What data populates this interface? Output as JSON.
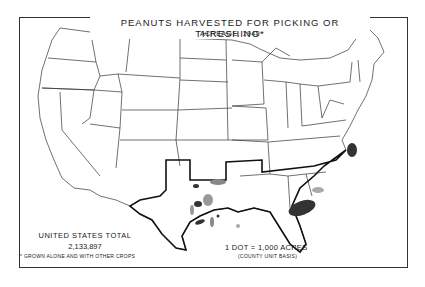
{
  "map": {
    "title": "PEANUTS HARVESTED FOR PICKING OR THRESHING*",
    "subtitle": "ACREAGE, 1949",
    "region": "United States",
    "highlighted_region_outline": "Southern peanut-growing states (Texas, Oklahoma, Louisiana, Mississippi, Alabama, Georgia, Florida, South Carolina)",
    "total": {
      "label": "UNITED STATES TOTAL",
      "value": "2,133,897"
    },
    "footnote": "* GROWN ALONE AND WITH OTHER CROPS",
    "legend": {
      "dot_value": "1 DOT = 1,000 ACRES",
      "basis": "(COUNTY UNIT BASIS)"
    },
    "concentrations": [
      {
        "area": "Southeastern Virginia / Northeastern North Carolina",
        "density": "high"
      },
      {
        "area": "Southwestern Georgia / Southeastern Alabama",
        "density": "high"
      },
      {
        "area": "Central Texas",
        "density": "medium"
      },
      {
        "area": "Southern Oklahoma",
        "density": "medium"
      },
      {
        "area": "South Texas",
        "density": "low"
      }
    ],
    "colors": {
      "background": "#ffffff",
      "lines": "#222222",
      "dots": "#333333"
    }
  }
}
